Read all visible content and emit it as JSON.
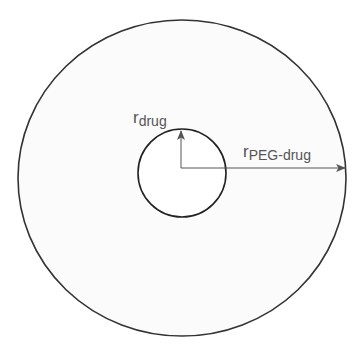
{
  "diagram": {
    "outer_circle": {
      "cx": 182,
      "cy": 178,
      "rx": 164,
      "ry": 158,
      "fill": "#fbfbfb",
      "stroke": "#333333"
    },
    "inner_circle": {
      "cx": 183,
      "cy": 173,
      "r": 44,
      "fill": "#ffffff",
      "stroke": "#222222"
    },
    "labels": {
      "r_drug": {
        "main": "r",
        "sub": "drug"
      },
      "r_peg_drug": {
        "main": "r",
        "sub": "PEG-drug"
      }
    },
    "colors": {
      "arrow": "#555555",
      "text": "#555555"
    }
  }
}
